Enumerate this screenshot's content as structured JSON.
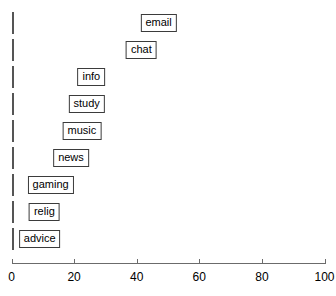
{
  "chart_data": {
    "type": "bar",
    "orientation": "horizontal",
    "title": "",
    "subtitle": "",
    "xlabel": "",
    "ylabel": "",
    "categories": [
      "email",
      "chat",
      "info",
      "study",
      "music",
      "news",
      "gaming",
      "relig",
      "advice"
    ],
    "values": [
      94,
      83,
      51,
      48,
      45,
      38,
      25,
      21,
      18
    ],
    "series": [
      {
        "name": "",
        "values": [
          94,
          83,
          51,
          48,
          45,
          38,
          25,
          21,
          18
        ]
      }
    ],
    "xlim": [
      0,
      100
    ],
    "xticks": [
      0,
      20,
      40,
      60,
      80,
      100
    ],
    "xtick_labels": [
      "0",
      "20",
      "40",
      "60",
      "80",
      "100"
    ],
    "grid": false,
    "legend": false,
    "legend_position": "none",
    "annotations": [
      "email",
      "chat",
      "info",
      "study",
      "music",
      "news",
      "gaming",
      "relig",
      "advice"
    ]
  },
  "style": {
    "bar_fill": "#a8a8a8",
    "bar_border": "#555555",
    "label_box_bg": "#ffffff",
    "label_box_border": "#3b3b3b",
    "axis_color": "#6b6b6b",
    "text_color": "#000000",
    "background": "#ffffff"
  }
}
